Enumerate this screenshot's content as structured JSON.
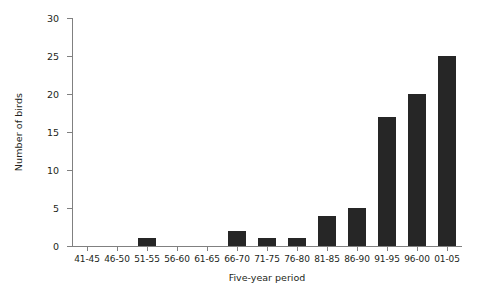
{
  "chart_data": {
    "type": "bar",
    "title": "",
    "xlabel": "Five-year period",
    "ylabel": "Number of birds",
    "categories": [
      "41-45",
      "46-50",
      "51-55",
      "56-60",
      "61-65",
      "66-70",
      "71-75",
      "76-80",
      "81-85",
      "86-90",
      "91-95",
      "96-00",
      "01-05"
    ],
    "values": [
      0,
      0,
      1,
      0,
      0,
      2,
      1,
      1,
      4,
      5,
      17,
      20,
      25
    ],
    "ylim": [
      0,
      30
    ],
    "yticks": [
      0,
      5,
      10,
      15,
      20,
      25,
      30
    ],
    "ytick_labels": [
      "0",
      "5",
      "10",
      "15",
      "20",
      "25",
      "30"
    ],
    "grid": false,
    "legend": false,
    "bar_color": "#262626",
    "axis_color": "#808080",
    "background": "#ffffff"
  }
}
